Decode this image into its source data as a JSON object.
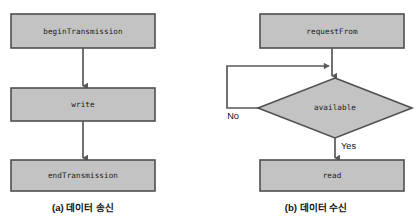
{
  "figure": {
    "background_color": "#ffffff",
    "shape_fill_color": "#c3c3c3",
    "shape_border_color": "#4f4f4f",
    "line_color": "#595959",
    "panels": [
      {
        "id": "panel-a",
        "caption": "(a) 데이터 송신",
        "nodes": [
          {
            "id": "begin-transmission",
            "label": "beginTransmission",
            "shape": "rectangle"
          },
          {
            "id": "write",
            "label": "write",
            "shape": "rectangle"
          },
          {
            "id": "end-transmission",
            "label": "endTransmission",
            "shape": "rectangle"
          }
        ],
        "edges": [
          {
            "from": "begin-transmission",
            "to": "write",
            "label": ""
          },
          {
            "from": "write",
            "to": "end-transmission",
            "label": ""
          }
        ]
      },
      {
        "id": "panel-b",
        "caption": "(b) 데이터 수신",
        "nodes": [
          {
            "id": "request-from",
            "label": "requestFrom",
            "shape": "rectangle"
          },
          {
            "id": "available",
            "label": "available",
            "shape": "diamond"
          },
          {
            "id": "read",
            "label": "read",
            "shape": "rectangle"
          }
        ],
        "edges": [
          {
            "from": "request-from",
            "to": "available",
            "label": ""
          },
          {
            "from": "available",
            "to": "request-from-join",
            "label": "No"
          },
          {
            "from": "available",
            "to": "read",
            "label": "Yes"
          }
        ]
      }
    ]
  }
}
